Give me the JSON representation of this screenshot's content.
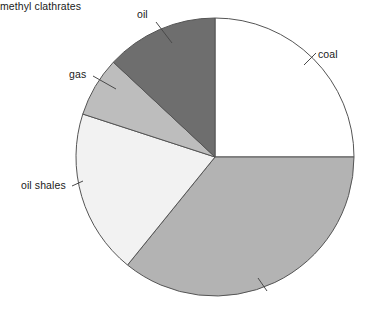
{
  "chart_data": {
    "type": "pie",
    "title": "",
    "subtitle": "",
    "xlabel": "",
    "ylabel": "",
    "grid": false,
    "legend_position": "none",
    "label_style": "external-with-leader-lines",
    "start_angle_deg": 0,
    "direction": "clockwise",
    "units": "percent of total",
    "categories": [
      "coal",
      "methyl clathrates",
      "oil shales",
      "gas",
      "oil"
    ],
    "values": [
      25,
      36,
      19,
      7,
      13
    ],
    "slices": [
      {
        "label": "coal",
        "value": 25,
        "start_angle_deg": 0,
        "end_angle_deg": 90,
        "color": "#ffffff",
        "label_x": 318,
        "label_y": 48
      },
      {
        "label": "methyl clathrates",
        "value": 36,
        "start_angle_deg": 90,
        "end_angle_deg": 219,
        "color": "#b3b3b3",
        "label_x": 266,
        "label_y": 292
      },
      {
        "label": "oil shales",
        "value": 19,
        "start_angle_deg": 219,
        "end_angle_deg": 288,
        "color": "#f2f2f2",
        "label_x": 21,
        "label_y": 179
      },
      {
        "label": "gas",
        "value": 7,
        "start_angle_deg": 288,
        "end_angle_deg": 313,
        "color": "#bdbdbd",
        "label_x": 69,
        "label_y": 68
      },
      {
        "label": "oil",
        "value": 13,
        "start_angle_deg": 313,
        "end_angle_deg": 360,
        "color": "#6e6e6e",
        "label_x": 137,
        "label_y": 8
      }
    ],
    "geometry": {
      "center_x": 215,
      "center_y": 157,
      "radius": 139,
      "outline_color": "#555555"
    },
    "colors": {
      "coal": "#ffffff",
      "methyl_clathrates": "#b3b3b3",
      "oil_shales": "#f2f2f2",
      "gas": "#bdbdbd",
      "oil": "#6e6e6e",
      "outline": "#555555",
      "text": "#1a1a1a",
      "background": "#ffffff"
    }
  },
  "labels": {
    "coal": "coal",
    "methyl_clathrates": "methyl clathrates",
    "oil_shales": "oil shales",
    "gas": "gas",
    "oil": "oil"
  }
}
